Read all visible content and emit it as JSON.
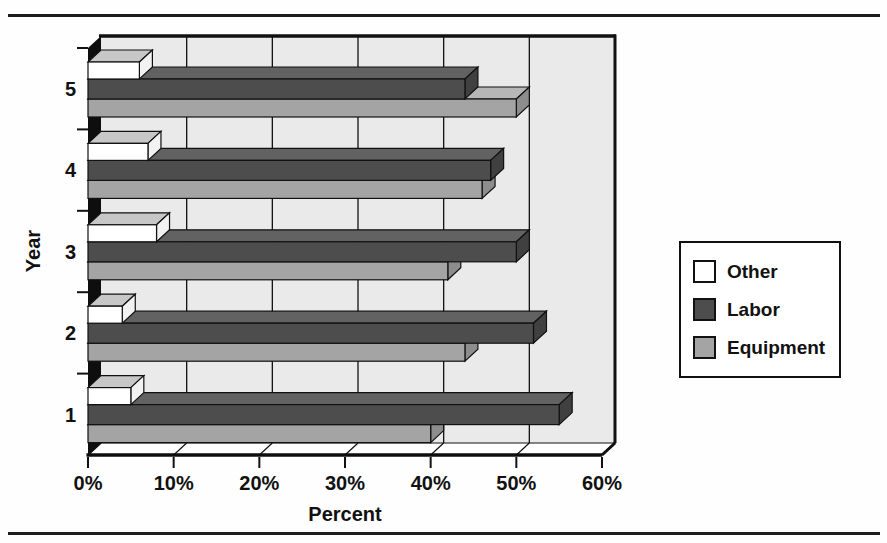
{
  "page": {
    "background": "#ffffff",
    "rule_color": "#1c1c1c"
  },
  "chart_data": {
    "type": "bar",
    "style": "3d",
    "orientation": "horizontal",
    "title": "",
    "xlabel": "Percent",
    "ylabel": "Year",
    "categories": [
      "1",
      "2",
      "3",
      "4",
      "5"
    ],
    "series": [
      {
        "name": "Other",
        "values": [
          5,
          4,
          8,
          7,
          6
        ],
        "color": "#ffffff",
        "top_color": "#c7c7c7",
        "end_color": "#f2f2f2"
      },
      {
        "name": "Labor",
        "values": [
          55,
          52,
          50,
          47,
          44
        ],
        "color": "#4d4d4d",
        "top_color": "#626262",
        "end_color": "#404040"
      },
      {
        "name": "Equipment",
        "values": [
          40,
          44,
          42,
          46,
          50
        ],
        "color": "#a4a4a4",
        "top_color": "#b7b7b7",
        "end_color": "#8d8d8d"
      }
    ],
    "x_ticks": [
      "0%",
      "10%",
      "20%",
      "30%",
      "40%",
      "50%",
      "60%"
    ],
    "xlim": [
      0,
      60
    ],
    "grid": "vertical",
    "legend_position": "right",
    "wall_color": "#eaeaea",
    "floor_color": "#ffffff",
    "side_wall_color": "#0e0e0e",
    "outline_color": "#111111"
  }
}
